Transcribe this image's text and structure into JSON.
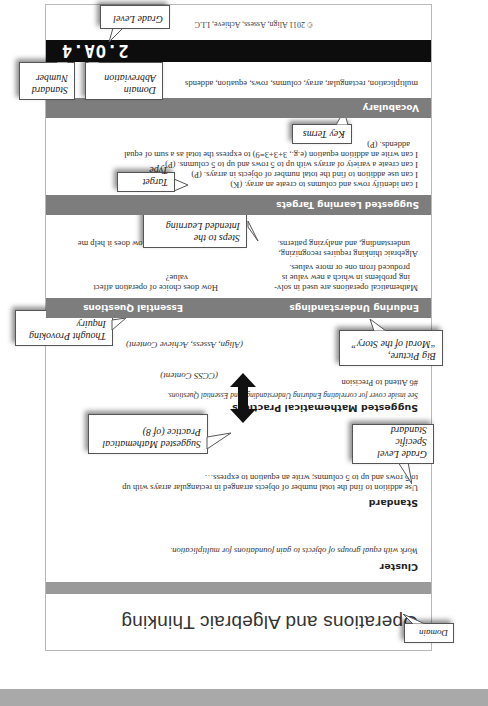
{
  "page": {
    "domain_title": "Operations and Algebraic Thinking",
    "cluster": {
      "label": "Cluster",
      "text": "Work with equal groups of objects to gain foundations for multiplication."
    },
    "standard": {
      "label": "Standard",
      "line1": "Use addition to find the total number of objects arranged in rectangular arrays with up",
      "line2": "to 5 rows and up to 5 columns; write an equation to express…"
    },
    "practices": {
      "label": "Suggested Mathematical Practices",
      "note": "See inside cover for correlating Enduring Understandings and Essential Questions.",
      "item": "#6 Attend to Precision"
    },
    "arrow_labels": {
      "top": "(CCSS Content)",
      "bottom": "(Align, Assess, Achieve Content)"
    },
    "enduring": {
      "label": "Enduring Understandings",
      "items": [
        "Mathematical operations are used in solv-",
        "ing problems in which a new value is",
        "produced from one or more values.",
        "Algebraic thinking requires recognizing,",
        "understanding, and analyzing patterns."
      ]
    },
    "essential": {
      "label": "Essential Questions",
      "items": [
        "How does choice of operation affect",
        "value?",
        "Algebraic thinking: How does it help me",
        "solve problems?"
      ]
    },
    "targets": {
      "label": "Suggested Learning Targets",
      "items": [
        "I can identify rows and columns to create an array. (K)",
        "I can use addition to find the total number of objects in arrays. (P)",
        "I can create a variety of arrays with up to 5 rows and up to 5 columns. (P)",
        "I can write an addition equation (e.g., 3+3+3=9) to express the total as a sum of equal",
        "addends. (P)"
      ]
    },
    "vocabulary": {
      "label": "Vocabulary",
      "text": "multiplication, rectangular, array, columns, rows, equation, addends"
    },
    "standard_code": "2.OA.4",
    "copyright": "© 2011 Align, Assess, Achieve, LLC"
  },
  "callouts": {
    "domain": "Domain",
    "grade_specific": [
      "Grade Level",
      "Specific Standard"
    ],
    "suggested_practice": [
      "Suggested Mathematical",
      "Practice (of 8)"
    ],
    "big_picture": [
      "Big Picture,",
      "“Moral of the Story”"
    ],
    "thought_provoking": [
      "Thought Provoking",
      "Inquiry"
    ],
    "steps": [
      "Steps to the",
      "Intended Learning"
    ],
    "target_type": "Target Type",
    "key_terms": "Key Terms",
    "domain_abbrev": [
      "Domain",
      "Abbreviation"
    ],
    "standard_number": [
      "Standard",
      "Number"
    ],
    "grade_level": "Grade Level"
  },
  "colors": {
    "section_header": "#7d7d7d",
    "code_bar": "#0d0d0d",
    "top_bar": "#a9a9a9"
  }
}
